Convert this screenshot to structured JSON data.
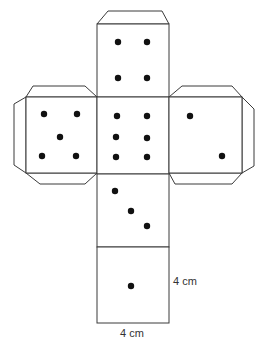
{
  "diagram": {
    "dimension_labels": {
      "height": "4 cm",
      "width": "4 cm"
    },
    "faces": [
      {
        "name": "top",
        "pips": 4
      },
      {
        "name": "left",
        "pips": 5
      },
      {
        "name": "center",
        "pips": 6
      },
      {
        "name": "right",
        "pips": 2
      },
      {
        "name": "lower",
        "pips": 3
      },
      {
        "name": "bottom",
        "pips": 1
      }
    ],
    "colors": {
      "line": "#3a3a3a",
      "pip": "#111111",
      "background": "#ffffff"
    }
  }
}
